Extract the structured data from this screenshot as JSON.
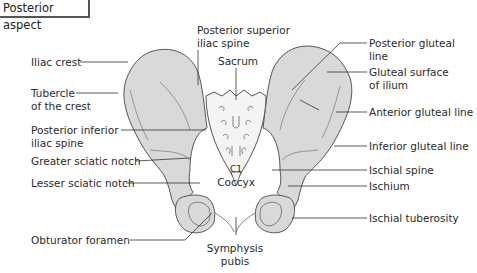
{
  "header": {
    "title": "Posterior aspect"
  },
  "colors": {
    "bone_fill": "#d9d9d9",
    "bone_stroke": "#555555",
    "sacrum_fill": "#f4f4f4",
    "leader": "#333333",
    "background": "#ffffff"
  },
  "labels": {
    "left": [
      {
        "id": "iliac-crest",
        "text": "Iliac crest"
      },
      {
        "id": "tubercle-of-crest",
        "text": "Tubercle\nof the crest"
      },
      {
        "id": "posterior-inferior-iliac-spine",
        "text": "Posterior inferior\niliac spine"
      },
      {
        "id": "greater-sciatic-notch",
        "text": "Greater sciatic notch"
      },
      {
        "id": "lesser-sciatic-notch",
        "text": "Lesser sciatic notch"
      },
      {
        "id": "obturator-foramen",
        "text": "Obturator foramen"
      }
    ],
    "center": [
      {
        "id": "posterior-superior-iliac-spine",
        "text": "Posterior superior\niliac spine"
      },
      {
        "id": "sacrum",
        "text": "Sacrum"
      },
      {
        "id": "c1",
        "text": "C1"
      },
      {
        "id": "coccyx",
        "text": "Coccyx"
      },
      {
        "id": "symphysis-pubis",
        "text": "Symphysis\npubis"
      }
    ],
    "right": [
      {
        "id": "posterior-gluteal-line",
        "text": "Posterior gluteal line"
      },
      {
        "id": "gluteal-surface-of-ilium",
        "text": "Gluteal surface\nof ilium"
      },
      {
        "id": "anterior-gluteal-line",
        "text": "Anterior gluteal line"
      },
      {
        "id": "inferior-gluteal-line",
        "text": "Inferior gluteal line"
      },
      {
        "id": "ischial-spine",
        "text": "Ischial spine"
      },
      {
        "id": "ischium",
        "text": "Ischium"
      },
      {
        "id": "ischial-tuberosity",
        "text": "Ischial tuberosity"
      }
    ]
  }
}
